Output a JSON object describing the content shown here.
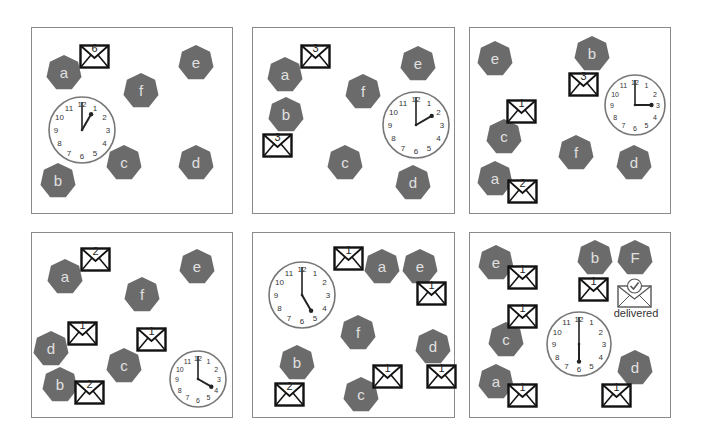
{
  "figure": {
    "colors": {
      "node_fill": "#6b6b6b",
      "node_label": "#e0e0e0",
      "panel_border": "#8a8a8a",
      "envelope_stroke": "#111111"
    },
    "panels": [
      {
        "id": 1,
        "box": [
          31,
          27,
          202,
          187
        ],
        "clock": {
          "time": "1:00",
          "hour": 1,
          "x": 47,
          "y": 95,
          "r": 33
        },
        "nodes": [
          {
            "label": "a",
            "x": 46,
            "y": 55
          },
          {
            "label": "b",
            "x": 40,
            "y": 163
          },
          {
            "label": "c",
            "x": 106,
            "y": 145
          },
          {
            "label": "d",
            "x": 178,
            "y": 145
          },
          {
            "label": "e",
            "x": 178,
            "y": 45
          },
          {
            "label": "f",
            "x": 123,
            "y": 73
          }
        ],
        "envelopes": [
          {
            "num": "6",
            "x": 79,
            "y": 44
          }
        ]
      },
      {
        "id": 2,
        "box": [
          252,
          27,
          203,
          187
        ],
        "clock": {
          "time": "2:00",
          "hour": 2,
          "x": 381,
          "y": 90,
          "r": 33
        },
        "nodes": [
          {
            "label": "a",
            "x": 267,
            "y": 57
          },
          {
            "label": "b",
            "x": 268,
            "y": 97
          },
          {
            "label": "c",
            "x": 327,
            "y": 145
          },
          {
            "label": "d",
            "x": 395,
            "y": 165
          },
          {
            "label": "e",
            "x": 400,
            "y": 46
          },
          {
            "label": "f",
            "x": 345,
            "y": 74
          }
        ],
        "envelopes": [
          {
            "num": "3",
            "x": 300,
            "y": 44
          },
          {
            "num": "3",
            "x": 262,
            "y": 133
          }
        ]
      },
      {
        "id": 3,
        "box": [
          469,
          27,
          202,
          187
        ],
        "clock": {
          "time": "3:00",
          "hour": 3,
          "x": 603,
          "y": 73,
          "r": 30
        },
        "nodes": [
          {
            "label": "e",
            "x": 477,
            "y": 41
          },
          {
            "label": "b",
            "x": 574,
            "y": 36
          },
          {
            "label": "c",
            "x": 486,
            "y": 119
          },
          {
            "label": "a",
            "x": 477,
            "y": 161
          },
          {
            "label": "f",
            "x": 558,
            "y": 135
          },
          {
            "label": "d",
            "x": 616,
            "y": 145
          }
        ],
        "envelopes": [
          {
            "num": "3",
            "x": 568,
            "y": 72
          },
          {
            "num": "1",
            "x": 506,
            "y": 99
          },
          {
            "num": "2",
            "x": 507,
            "y": 179
          }
        ]
      },
      {
        "id": 4,
        "box": [
          31,
          232,
          202,
          186
        ],
        "clock": {
          "time": "4:00",
          "hour": 4,
          "x": 168,
          "y": 349,
          "r": 28
        },
        "nodes": [
          {
            "label": "a",
            "x": 47,
            "y": 259
          },
          {
            "label": "b",
            "x": 42,
            "y": 367
          },
          {
            "label": "c",
            "x": 106,
            "y": 348
          },
          {
            "label": "d",
            "x": 33,
            "y": 331
          },
          {
            "label": "e",
            "x": 179,
            "y": 249
          },
          {
            "label": "f",
            "x": 124,
            "y": 277
          }
        ],
        "envelopes": [
          {
            "num": "2",
            "x": 80,
            "y": 247
          },
          {
            "num": "1",
            "x": 67,
            "y": 321
          },
          {
            "num": "1",
            "x": 136,
            "y": 327
          },
          {
            "num": "2",
            "x": 74,
            "y": 380
          }
        ]
      },
      {
        "id": 5,
        "box": [
          252,
          232,
          203,
          186
        ],
        "clock": {
          "time": "5:00",
          "hour": 5,
          "x": 267,
          "y": 260,
          "r": 33
        },
        "nodes": [
          {
            "label": "a",
            "x": 364,
            "y": 249
          },
          {
            "label": "b",
            "x": 279,
            "y": 345
          },
          {
            "label": "c",
            "x": 343,
            "y": 377
          },
          {
            "label": "d",
            "x": 415,
            "y": 329
          },
          {
            "label": "e",
            "x": 402,
            "y": 249
          },
          {
            "label": "f",
            "x": 340,
            "y": 315
          }
        ],
        "envelopes": [
          {
            "num": "1",
            "x": 333,
            "y": 246
          },
          {
            "num": "1",
            "x": 416,
            "y": 281
          },
          {
            "num": "1",
            "x": 372,
            "y": 364
          },
          {
            "num": "1",
            "x": 426,
            "y": 364
          },
          {
            "num": "2",
            "x": 274,
            "y": 382
          }
        ]
      },
      {
        "id": 6,
        "box": [
          469,
          232,
          202,
          186
        ],
        "clock": {
          "time": "6:00",
          "hour": 6,
          "x": 545,
          "y": 310,
          "r": 32
        },
        "nodes": [
          {
            "label": "e",
            "x": 478,
            "y": 245
          },
          {
            "label": "b",
            "x": 577,
            "y": 240
          },
          {
            "label": "F",
            "x": 617,
            "y": 240
          },
          {
            "label": "c",
            "x": 488,
            "y": 322
          },
          {
            "label": "a",
            "x": 478,
            "y": 364
          },
          {
            "label": "d",
            "x": 617,
            "y": 350
          }
        ],
        "envelopes": [
          {
            "num": "1",
            "x": 507,
            "y": 265
          },
          {
            "num": "1",
            "x": 507,
            "y": 304
          },
          {
            "num": "1",
            "x": 578,
            "y": 277
          },
          {
            "num": "1",
            "x": 507,
            "y": 383
          },
          {
            "num": "1",
            "x": 601,
            "y": 383
          }
        ],
        "delivered": {
          "label": "delivered",
          "x": 617,
          "y": 277
        }
      }
    ]
  }
}
